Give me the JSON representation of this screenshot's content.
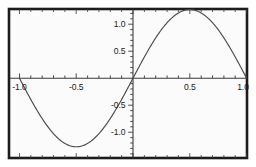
{
  "figure": {
    "background_color": "#ffffff",
    "plot_background_color": "#fbfbfb",
    "frame_color": "#1c1c1c",
    "axis_color": "#3a3a3a",
    "curve_color": "#4a4a4a",
    "tick_color": "#3a3a3a"
  },
  "chart_data": {
    "type": "line",
    "title": "",
    "xlabel": "",
    "ylabel": "",
    "xlim": [
      -1.05,
      1.05
    ],
    "ylim": [
      -1.38,
      1.38
    ],
    "grid": false,
    "legend": null,
    "x_ticks": [
      -1.0,
      -0.5,
      0.5,
      1.0
    ],
    "x_tick_labels": [
      "-1.0",
      "-0.5",
      "0.5",
      "1.0"
    ],
    "y_ticks": [
      -1.0,
      -0.5,
      0.5,
      1.0
    ],
    "y_tick_labels": [
      "-1.0",
      "-0.5",
      "0.5",
      "1.0"
    ],
    "x_minor_ticks": [
      -0.9,
      -0.8,
      -0.7,
      -0.6,
      -0.4,
      -0.3,
      -0.2,
      -0.1,
      0.1,
      0.2,
      0.3,
      0.4,
      0.6,
      0.7,
      0.8,
      0.9
    ],
    "y_minor_ticks": [
      -1.2,
      -1.1,
      -0.9,
      -0.8,
      -0.7,
      -0.6,
      -0.4,
      -0.3,
      -0.2,
      -0.1,
      0.1,
      0.2,
      0.3,
      0.4,
      0.6,
      0.7,
      0.8,
      0.9,
      1.1,
      1.2
    ],
    "series": [
      {
        "name": "curve",
        "amplitude": 1.27,
        "period": 2.0,
        "x": [
          -1.0,
          -0.95,
          -0.9,
          -0.85,
          -0.8,
          -0.75,
          -0.7,
          -0.65,
          -0.6,
          -0.55,
          -0.5,
          -0.45,
          -0.4,
          -0.35,
          -0.3,
          -0.25,
          -0.2,
          -0.15,
          -0.1,
          -0.05,
          0.0,
          0.05,
          0.1,
          0.15,
          0.2,
          0.25,
          0.3,
          0.35,
          0.4,
          0.45,
          0.5,
          0.55,
          0.6,
          0.65,
          0.7,
          0.75,
          0.8,
          0.85,
          0.9,
          0.95,
          1.0
        ],
        "values": [
          0.0,
          -0.199,
          -0.392,
          -0.577,
          -0.747,
          -0.898,
          -1.027,
          -1.13,
          -1.207,
          -1.254,
          -1.27,
          -1.254,
          -1.207,
          -1.13,
          -1.027,
          -0.898,
          -0.747,
          -0.577,
          -0.392,
          -0.199,
          0.0,
          0.199,
          0.392,
          0.577,
          0.747,
          0.898,
          1.027,
          1.13,
          1.207,
          1.254,
          1.27,
          1.254,
          1.207,
          1.13,
          1.027,
          0.898,
          0.747,
          0.577,
          0.392,
          0.199,
          0.0
        ]
      }
    ],
    "annotations": []
  }
}
